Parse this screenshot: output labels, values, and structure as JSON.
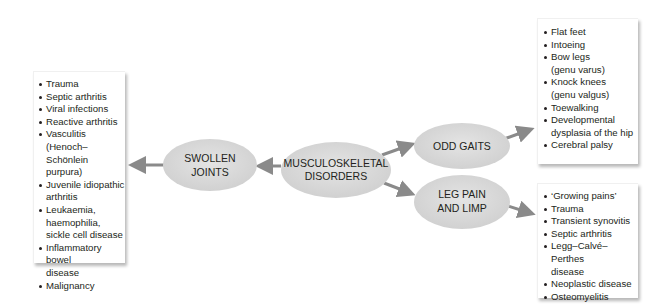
{
  "diagram": {
    "center_node": {
      "line1": "MUSCULOSKELETAL",
      "line2": "DISORDERS"
    },
    "branches": [
      {
        "id": "swollen-joints",
        "label_line1": "SWOLLEN",
        "label_line2": "JOINTS",
        "items": [
          [
            "Trauma"
          ],
          [
            "Septic arthritis"
          ],
          [
            "Viral infections"
          ],
          [
            "Reactive arthritis"
          ],
          [
            "Vasculitis (Henoch–",
            "Schönlein purpura)"
          ],
          [
            "Juvenile idiopathic",
            "arthritis"
          ],
          [
            "Leukaemia,",
            "haemophilia,",
            "sickle cell disease"
          ],
          [
            "Inflammatory bowel",
            "disease"
          ],
          [
            "Malignancy"
          ]
        ]
      },
      {
        "id": "odd-gaits",
        "label_line1": "ODD GAITS",
        "items": [
          [
            "Flat feet"
          ],
          [
            "Intoeing"
          ],
          [
            "Bow legs",
            "(genu varus)"
          ],
          [
            "Knock knees",
            "(genu valgus)"
          ],
          [
            "Toewalking"
          ],
          [
            "Developmental",
            "dysplasia of the hip"
          ],
          [
            "Cerebral palsy"
          ]
        ]
      },
      {
        "id": "leg-pain-and-limp",
        "label_line1": "LEG PAIN",
        "label_line2": "AND LIMP",
        "items": [
          [
            "‘Growing pains’"
          ],
          [
            "Trauma"
          ],
          [
            "Transient synovitis"
          ],
          [
            "Septic arthritis"
          ],
          [
            "Legg–Calvé–Perthes",
            "disease"
          ],
          [
            "Neoplastic disease"
          ],
          [
            "Osteomyelitis"
          ]
        ]
      }
    ],
    "colors": {
      "node_fill": "#d9d9d9",
      "arrow": "#8a8a8a",
      "text": "#231f20",
      "box_bg": "#ffffff"
    }
  }
}
